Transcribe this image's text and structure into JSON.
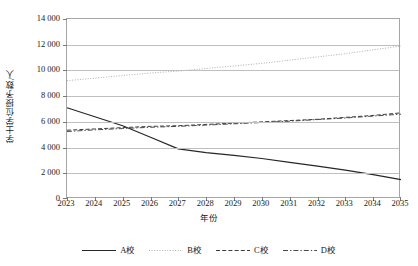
{
  "chart_data": {
    "type": "line",
    "title": "",
    "xlabel": "年份",
    "ylabel": "学士学位授予数/人",
    "x": [
      2023,
      2024,
      2025,
      2026,
      2027,
      2028,
      2029,
      2030,
      2031,
      2032,
      2033,
      2034,
      2035
    ],
    "xtick_labels": [
      "2023",
      "2024",
      "2025",
      "2026",
      "2027",
      "2028",
      "2029",
      "2030",
      "2031",
      "2032",
      "2033",
      "2034",
      "2035"
    ],
    "ylim": [
      0,
      14000
    ],
    "ytick_values": [
      0,
      2000,
      4000,
      6000,
      8000,
      10000,
      12000,
      14000
    ],
    "ytick_labels": [
      "0",
      "2 000",
      "4 000",
      "6 000",
      "8 000",
      "10 000",
      "12 000",
      "14 000"
    ],
    "grid": true,
    "legend_position": "bottom",
    "series": [
      {
        "name": "A校",
        "style": "solid",
        "color": "#262626",
        "values": [
          7100,
          6400,
          5700,
          4800,
          3900,
          3600,
          3400,
          3150,
          2850,
          2550,
          2250,
          1900,
          1500
        ]
      },
      {
        "name": "B校",
        "style": "dotted",
        "color": "#b0b0b0",
        "values": [
          9200,
          9400,
          9600,
          9800,
          9950,
          10150,
          10350,
          10550,
          10800,
          11050,
          11300,
          11600,
          11900
        ]
      },
      {
        "name": "C校",
        "style": "dashed",
        "color": "#3d3d3d",
        "values": [
          5350,
          5450,
          5550,
          5650,
          5700,
          5800,
          5900,
          6000,
          6100,
          6200,
          6350,
          6500,
          6700
        ]
      },
      {
        "name": "D校",
        "style": "dashdot",
        "color": "#4a4a4a",
        "values": [
          5250,
          5380,
          5480,
          5580,
          5650,
          5750,
          5850,
          5950,
          6050,
          6180,
          6300,
          6450,
          6600
        ]
      }
    ]
  },
  "legend": {
    "items": [
      {
        "label": "A校",
        "style": "solid"
      },
      {
        "label": "B校",
        "style": "dotted"
      },
      {
        "label": "C校",
        "style": "dashed"
      },
      {
        "label": "D校",
        "style": "dashdot"
      }
    ]
  }
}
